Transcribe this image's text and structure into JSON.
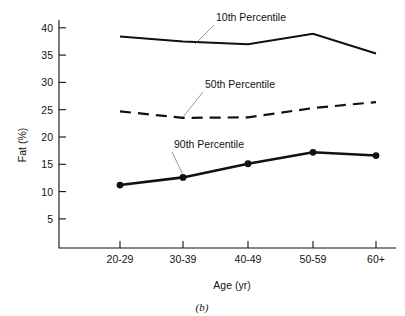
{
  "figure": {
    "caption": "(b)",
    "background": "#ffffff",
    "ink_color": "#111111"
  },
  "chart_data": {
    "type": "line",
    "title": "",
    "subtitle": "",
    "xlabel": "Age (yr)",
    "ylabel": "Fat (%)",
    "categories": [
      "20-29",
      "30-39",
      "40-49",
      "50-59",
      "60+"
    ],
    "ylim": [
      0,
      41
    ],
    "yticks": [
      5,
      10,
      15,
      20,
      25,
      30,
      35,
      40
    ],
    "ytick_labels": [
      "5",
      "10",
      "15",
      "20",
      "25",
      "30",
      "35",
      "40"
    ],
    "grid": false,
    "legend_position": "inline-annotations",
    "series": [
      {
        "name": "10th Percentile",
        "values": [
          38.4,
          37.5,
          37.0,
          38.9,
          35.3
        ],
        "style": "solid",
        "markers": false,
        "linewidth": 2.0,
        "color": "#111111"
      },
      {
        "name": "50th Percentile",
        "values": [
          24.7,
          23.5,
          23.6,
          25.3,
          26.4
        ],
        "style": "dashed",
        "markers": false,
        "linewidth": 2.2,
        "color": "#111111"
      },
      {
        "name": "90th Percentile",
        "values": [
          11.2,
          12.6,
          15.1,
          17.2,
          16.6
        ],
        "style": "solid",
        "markers": true,
        "linewidth": 2.6,
        "color": "#111111"
      }
    ],
    "annotations": [
      {
        "text": "10th Percentile",
        "points_to_series": "10th Percentile",
        "points_to_category": "30-39"
      },
      {
        "text": "50th Percentile",
        "points_to_series": "50th Percentile",
        "points_to_category": "30-39"
      },
      {
        "text": "90th Percentile",
        "points_to_series": "90th Percentile",
        "points_to_category": "30-39"
      }
    ]
  }
}
